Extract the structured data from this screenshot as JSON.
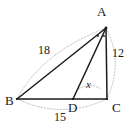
{
  "figure": {
    "type": "geometry-diagram",
    "background_color": "#ffffff",
    "stroke_color": "#1a1a1a",
    "guide_color": "#b0b0b0",
    "vertices": [
      {
        "name": "A",
        "label": "A",
        "x": 106,
        "y": 28,
        "label_x": 97,
        "label_y": 5
      },
      {
        "name": "B",
        "label": "B",
        "x": 17,
        "y": 99,
        "label_x": 6,
        "label_y": 97
      },
      {
        "name": "D",
        "label": "D",
        "x": 73,
        "y": 99,
        "label_x": 68,
        "label_y": 103
      },
      {
        "name": "C",
        "label": "C",
        "x": 107,
        "y": 99,
        "label_x": 112,
        "label_y": 103
      }
    ],
    "segments": [
      {
        "name": "AB",
        "from": "A",
        "to": "B",
        "style": "solid"
      },
      {
        "name": "BC",
        "from": "B",
        "to": "C",
        "style": "solid"
      },
      {
        "name": "AC",
        "from": "A",
        "to": "C",
        "style": "solid"
      },
      {
        "name": "AD",
        "from": "A",
        "to": "D",
        "style": "solid"
      }
    ],
    "measures": [
      {
        "name": "AB",
        "label": "18",
        "label_x": 38,
        "label_y": 44
      },
      {
        "name": "AC",
        "label": "12",
        "label_x": 112,
        "label_y": 47
      },
      {
        "name": "BC",
        "label": "15",
        "label_x": 54,
        "label_y": 110
      },
      {
        "name": "angle-x",
        "label": "x",
        "label_x": 85,
        "label_y": 85
      }
    ],
    "angle_marks": {
      "vertex": "A",
      "count": 2,
      "note": "equal angle tick marks at vertex A"
    },
    "guide_arcs": [
      {
        "name": "arc-AB",
        "from": "B",
        "to": "A"
      },
      {
        "name": "arc-AC",
        "from": "A",
        "to": "C"
      },
      {
        "name": "arc-BC",
        "from": "B",
        "to": "C"
      },
      {
        "name": "arc-angle-x",
        "from": "AD",
        "to": "AC"
      }
    ]
  }
}
